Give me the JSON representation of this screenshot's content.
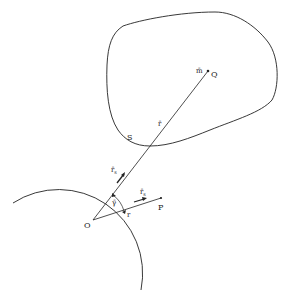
{
  "figure": {
    "type": "geometric-diagram",
    "stroke_color": "#222222",
    "background": "#ffffff",
    "labels": {
      "mass": "m̄",
      "point_q": "Q",
      "vector_r": "r̄",
      "point_s": "S",
      "vector_rs": "r̄",
      "vector_rs_sub": "s",
      "angle": "γ̄",
      "point_o": "O",
      "vector_small_r": "r",
      "unit_rs": "r̄",
      "unit_rs_sub": "s",
      "point_p": "P"
    },
    "elements": {
      "body_outline": "closed irregular region containing Q",
      "sphere_arc": "circular arc centered at O through S",
      "line_oq": "segment from O to Q passing through S",
      "line_op": "segment from O to P",
      "angle_arc": "arc marking angle between OQ and OP"
    }
  }
}
